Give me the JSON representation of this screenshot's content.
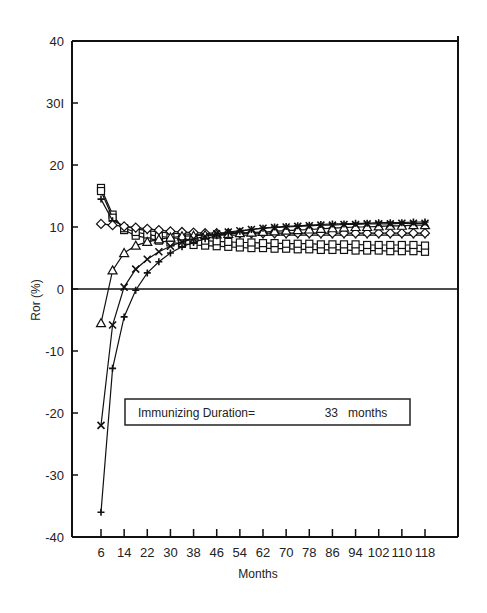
{
  "chart_data": {
    "type": "line",
    "title": "",
    "xlabel": "Months",
    "ylabel": "Ror (%)",
    "xlim": [
      0,
      126
    ],
    "ylim": [
      -40,
      40
    ],
    "x_ticks": [
      6,
      14,
      22,
      30,
      38,
      46,
      54,
      62,
      70,
      78,
      86,
      94,
      102,
      110,
      118
    ],
    "y_ticks": [
      40,
      30,
      20,
      10,
      0,
      -10,
      -20,
      -30,
      -40
    ],
    "y_tick_labels": [
      "40",
      "30I",
      "20",
      "10",
      "0",
      "-10",
      "-20",
      "-30",
      "-40"
    ],
    "grid": false,
    "zero_line": true,
    "annotation": {
      "label": "Immunizing Duration=",
      "value": "33",
      "unit": "months"
    },
    "x": [
      6,
      10,
      14,
      18,
      22,
      26,
      30,
      34,
      38,
      42,
      46,
      50,
      54,
      58,
      62,
      66,
      70,
      74,
      78,
      82,
      86,
      90,
      94,
      98,
      102,
      106,
      110,
      114,
      118
    ],
    "series": [
      {
        "name": "square",
        "marker": "square",
        "values": [
          16.3,
          12.0,
          9.5,
          8.6,
          8.2,
          7.8,
          7.5,
          7.3,
          7.1,
          7.0,
          6.9,
          6.8,
          6.7,
          6.6,
          6.6,
          6.5,
          6.5,
          6.4,
          6.4,
          6.3,
          6.3,
          6.3,
          6.2,
          6.2,
          6.2,
          6.1,
          6.1,
          6.1,
          6.0
        ]
      },
      {
        "name": "square-2",
        "marker": "square",
        "values": [
          15.8,
          11.5,
          9.8,
          9.2,
          8.8,
          8.5,
          8.3,
          8.1,
          7.9,
          7.8,
          7.7,
          7.6,
          7.5,
          7.5,
          7.4,
          7.4,
          7.3,
          7.3,
          7.3,
          7.2,
          7.2,
          7.2,
          7.2,
          7.1,
          7.1,
          7.1,
          7.1,
          7.1,
          7.0
        ]
      },
      {
        "name": "plus-top",
        "marker": "plus",
        "values": [
          14.5,
          11.0,
          10.2,
          9.7,
          9.4,
          9.2,
          9.0,
          8.9,
          8.8,
          8.7,
          8.7,
          8.7,
          8.7,
          8.7,
          8.7,
          8.7,
          8.7,
          8.7,
          8.7,
          8.7,
          8.7,
          8.7,
          8.7,
          8.7,
          8.7,
          8.7,
          8.7,
          8.7,
          8.7
        ]
      },
      {
        "name": "diamond",
        "marker": "diamond",
        "values": [
          10.5,
          10.3,
          10.1,
          9.9,
          9.7,
          9.5,
          9.3,
          9.2,
          9.1,
          9.0,
          9.0,
          9.0,
          9.0,
          9.0,
          9.0,
          9.0,
          9.0,
          9.0,
          9.0,
          9.0,
          9.0,
          9.0,
          9.0,
          9.0,
          9.0,
          9.0,
          9.0,
          9.0,
          9.0
        ]
      },
      {
        "name": "triangle",
        "marker": "triangle",
        "values": [
          -5.5,
          3.0,
          5.8,
          7.0,
          7.6,
          8.0,
          8.3,
          8.5,
          8.6,
          8.7,
          8.8,
          8.9,
          9.0,
          9.1,
          9.2,
          9.3,
          9.4,
          9.5,
          9.6,
          9.7,
          9.8,
          9.9,
          10.0,
          10.0,
          10.1,
          10.2,
          10.2,
          10.3,
          10.3
        ]
      },
      {
        "name": "x-cross",
        "marker": "x",
        "values": [
          -22.0,
          -5.8,
          0.3,
          3.2,
          4.8,
          6.0,
          6.9,
          7.6,
          8.1,
          8.5,
          8.9,
          9.2,
          9.4,
          9.6,
          9.8,
          9.9,
          10.0,
          10.1,
          10.2,
          10.3,
          10.3,
          10.4,
          10.4,
          10.5,
          10.5,
          10.5,
          10.6,
          10.6,
          10.6
        ]
      },
      {
        "name": "plus-bottom",
        "marker": "plus",
        "values": [
          -36.0,
          -12.8,
          -4.5,
          -0.2,
          2.6,
          4.4,
          5.8,
          6.8,
          7.5,
          8.1,
          8.6,
          9.0,
          9.3,
          9.6,
          9.8,
          10.0,
          10.1,
          10.2,
          10.3,
          10.4,
          10.5,
          10.5,
          10.6,
          10.6,
          10.7,
          10.7,
          10.7,
          10.8,
          10.8
        ]
      }
    ]
  }
}
